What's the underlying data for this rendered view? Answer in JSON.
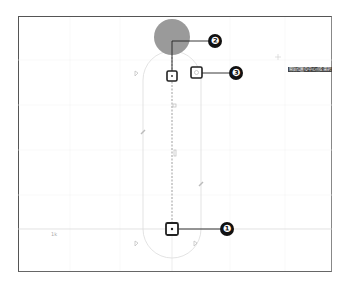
{
  "canvas": {
    "tooltip": "開始位置の中心点を選択",
    "axis_label": "1k",
    "dim_label_top": "0",
    "dim_label_mid": "00"
  },
  "callouts": [
    {
      "number": "❶",
      "target": "end-center-point"
    },
    {
      "number": "❷",
      "target": "start-center-point"
    },
    {
      "number": "❸",
      "target": "snap-point-icon"
    }
  ],
  "colors": {
    "cursor_circle": "#9a9a9a",
    "guide_line": "#d8d8d8",
    "frame": "#555555",
    "callout": "#111111"
  }
}
